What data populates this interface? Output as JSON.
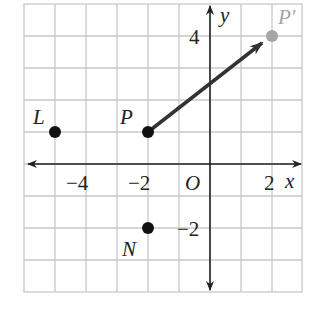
{
  "diagram": {
    "type": "coordinate-plane",
    "x_range": [
      -6,
      3
    ],
    "y_range": [
      -4,
      5
    ],
    "grid": true,
    "axis_labels": {
      "x": "x",
      "y": "y",
      "origin": "O"
    },
    "x_ticks": [
      {
        "value": -4,
        "label": "−4"
      },
      {
        "value": -2,
        "label": "−2"
      },
      {
        "value": 2,
        "label": "2"
      }
    ],
    "y_ticks": [
      {
        "value": 4,
        "label": "4"
      },
      {
        "value": -2,
        "label": "−2"
      }
    ],
    "points": [
      {
        "name": "L",
        "x": -5,
        "y": 1,
        "color": "#111111"
      },
      {
        "name": "P",
        "x": -2,
        "y": 1,
        "color": "#111111"
      },
      {
        "name": "N",
        "x": -2,
        "y": -2,
        "color": "#111111"
      },
      {
        "name": "P′",
        "x": 2,
        "y": 4,
        "color": "#a6a6a6"
      }
    ],
    "vectors": [
      {
        "from": "P",
        "to": "P′",
        "color": "#333333"
      }
    ],
    "colors": {
      "grid": "#c8c8c8",
      "axes": "#222222",
      "image_point": "#a6a6a6"
    }
  }
}
